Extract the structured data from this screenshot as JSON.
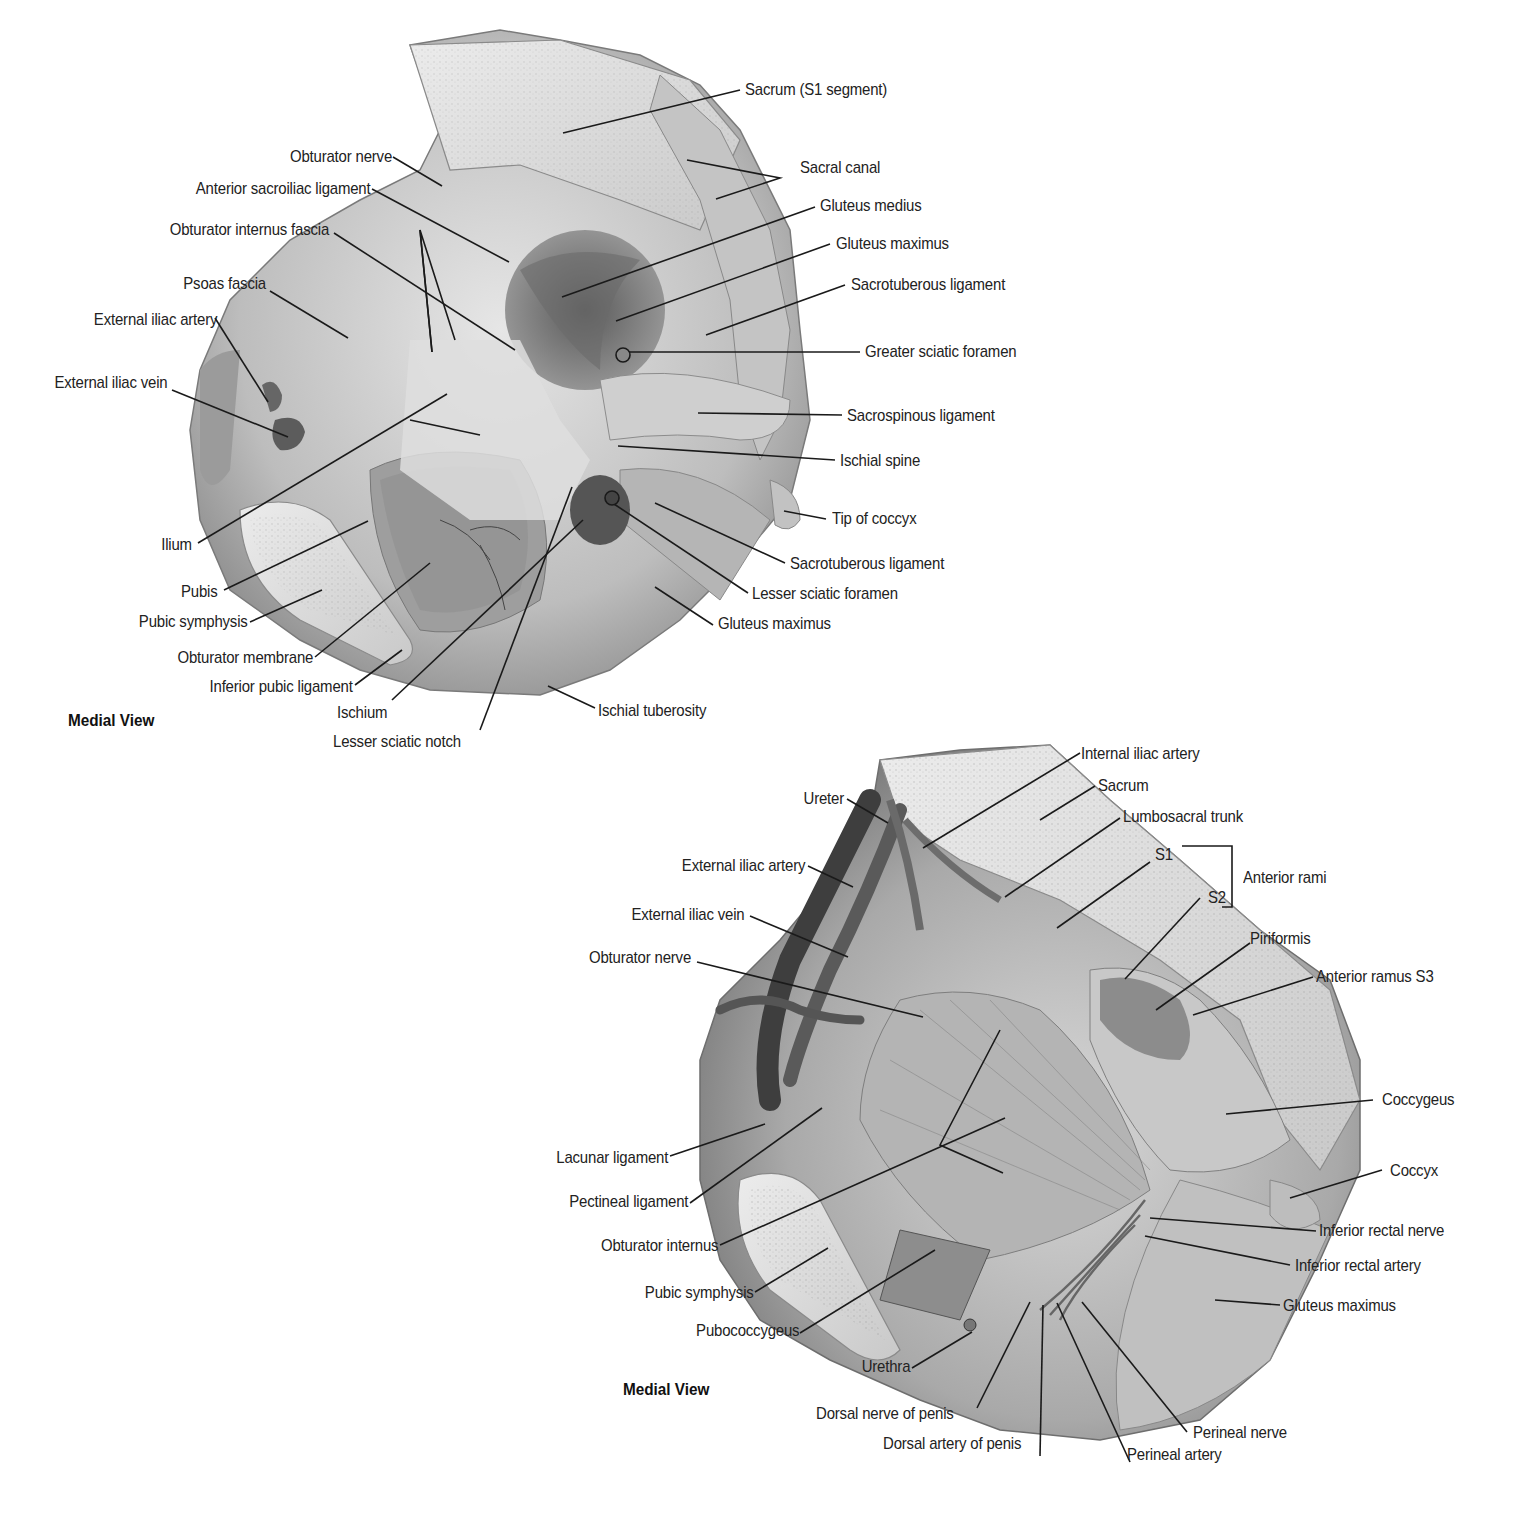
{
  "figure_a": {
    "view_title": "Medial View",
    "labels": {
      "sacrum_s1": "Sacrum (S1 segment)",
      "sacral_canal": "Sacral canal",
      "gluteus_medius": "Gluteus medius",
      "gluteus_maximus_upper": "Gluteus maximus",
      "sacrotuberous_upper": "Sacrotuberous ligament",
      "greater_sciatic_foramen": "Greater sciatic foramen",
      "sacrospinous_ligament": "Sacrospinous ligament",
      "ischial_spine": "Ischial spine",
      "tip_of_coccyx": "Tip of coccyx",
      "sacrotuberous_lower": "Sacrotuberous ligament",
      "lesser_sciatic_foramen": "Lesser sciatic foramen",
      "gluteus_maximus_lower": "Gluteus maximus",
      "ischial_tuberosity": "Ischial tuberosity",
      "obturator_nerve": "Obturator nerve",
      "anterior_sacroiliac_ligament": "Anterior sacroiliac ligament",
      "obturator_internus_fascia": "Obturator internus fascia",
      "psoas_fascia": "Psoas fascia",
      "external_iliac_artery": "External iliac artery",
      "external_iliac_vein": "External iliac vein",
      "ilium": "Ilium",
      "pubis": "Pubis",
      "pubic_symphysis": "Pubic symphysis",
      "obturator_membrane": "Obturator membrane",
      "inferior_pubic_ligament": "Inferior pubic ligament",
      "ischium": "Ischium",
      "lesser_sciatic_notch": "Lesser sciatic notch"
    }
  },
  "figure_b": {
    "view_title": "Medial View",
    "labels": {
      "internal_iliac_artery": "Internal iliac artery",
      "sacrum": "Sacrum",
      "lumbosacral_trunk": "Lumbosacral trunk",
      "s1": "S1",
      "s2": "S2",
      "anterior_rami": "Anterior rami",
      "piriformis": "Piriformis",
      "anterior_ramus_s3": "Anterior ramus S3",
      "coccygeus": "Coccygeus",
      "coccyx": "Coccyx",
      "inferior_rectal_nerve": "Inferior rectal nerve",
      "inferior_rectal_artery": "Inferior rectal artery",
      "gluteus_maximus": "Gluteus maximus",
      "ureter": "Ureter",
      "external_iliac_artery": "External iliac artery",
      "external_iliac_vein": "External iliac vein",
      "obturator_nerve": "Obturator nerve",
      "lacunar_ligament": "Lacunar ligament",
      "pectineal_ligament": "Pectineal ligament",
      "obturator_internus": "Obturator internus",
      "pubic_symphysis": "Pubic symphysis",
      "pubococcygeus": "Pubococcygeus",
      "urethra": "Urethra",
      "dorsal_nerve_of_penis": "Dorsal nerve of penis",
      "dorsal_artery_of_penis": "Dorsal artery of penis",
      "perineal_nerve": "Perineal nerve",
      "perineal_artery": "Perineal artery"
    }
  },
  "colors": {
    "background": "#ffffff",
    "label_text": "#222222",
    "leader_line": "#1a1a1a",
    "tissue_light": "#d9d9d9",
    "tissue_mid": "#a8a8a8",
    "tissue_dark": "#4a4a4a"
  }
}
